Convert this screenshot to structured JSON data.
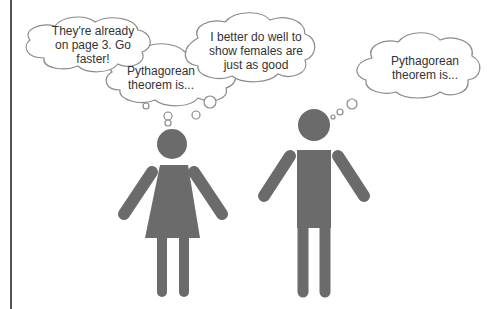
{
  "scene": {
    "description": "Cartoon of two stick figures (female and male) with thought bubbles",
    "colors": {
      "figure": "#6b6b6b",
      "bubble_stroke": "#8a8a8a",
      "text": "#333333",
      "border": "#555555"
    }
  },
  "bubbles": {
    "female_rushed": "They're already on page 3.  Go faster!",
    "female_theorem": "Pythagorean theorem is...",
    "female_pressure": "I better do well to show females are just as good",
    "male_theorem": "Pythagorean theorem is..."
  },
  "figures": {
    "female": "female-figure",
    "male": "male-figure"
  }
}
